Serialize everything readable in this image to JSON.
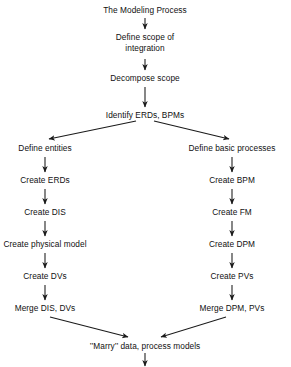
{
  "diagram": {
    "title": "The Modeling Process",
    "type": "flowchart",
    "orientation": "top-to-bottom",
    "colors": {
      "background": "#ffffff",
      "text": "#111111",
      "arrow": "#1a1a1a"
    },
    "nodes": [
      {
        "id": "title",
        "label": "The Modeling Process",
        "x": 145,
        "y": 5,
        "column": "center"
      },
      {
        "id": "scope",
        "label": "Define scope of\nintegration",
        "x": 145,
        "y": 32,
        "column": "center"
      },
      {
        "id": "decompose",
        "label": "Decompose scope",
        "x": 145,
        "y": 73,
        "column": "center"
      },
      {
        "id": "identify",
        "label": "Identify ERDs, BPMs",
        "x": 145,
        "y": 110,
        "column": "center"
      },
      {
        "id": "l1",
        "label": "Define entities",
        "x": 45,
        "y": 143,
        "column": "left"
      },
      {
        "id": "l2",
        "label": "Create ERDs",
        "x": 45,
        "y": 175,
        "column": "left"
      },
      {
        "id": "l3",
        "label": "Create DIS",
        "x": 45,
        "y": 207,
        "column": "left"
      },
      {
        "id": "l4",
        "label": "Create physical model",
        "x": 45,
        "y": 239,
        "column": "left"
      },
      {
        "id": "l5",
        "label": "Create DVs",
        "x": 45,
        "y": 271,
        "column": "left"
      },
      {
        "id": "l6",
        "label": "Merge DIS, DVs",
        "x": 45,
        "y": 303,
        "column": "left"
      },
      {
        "id": "r1",
        "label": "Define basic processes",
        "x": 232,
        "y": 143,
        "column": "right"
      },
      {
        "id": "r2",
        "label": "Create BPM",
        "x": 232,
        "y": 175,
        "column": "right"
      },
      {
        "id": "r3",
        "label": "Create FM",
        "x": 232,
        "y": 207,
        "column": "right"
      },
      {
        "id": "r4",
        "label": "Create DPM",
        "x": 232,
        "y": 239,
        "column": "right"
      },
      {
        "id": "r5",
        "label": "Create PVs",
        "x": 232,
        "y": 271,
        "column": "right"
      },
      {
        "id": "r6",
        "label": "Merge DPM, PVs",
        "x": 232,
        "y": 303,
        "column": "right"
      },
      {
        "id": "marry",
        "label": "’’Marry’’ data, process models",
        "x": 145,
        "y": 341,
        "column": "center"
      }
    ],
    "edges": [
      {
        "from": "title",
        "to": "scope",
        "kind": "vertical"
      },
      {
        "from": "scope",
        "to": "decompose",
        "kind": "vertical"
      },
      {
        "from": "decompose",
        "to": "identify",
        "kind": "vertical"
      },
      {
        "from": "identify",
        "to": "l1",
        "kind": "diagonal-left"
      },
      {
        "from": "identify",
        "to": "r1",
        "kind": "diagonal-right"
      },
      {
        "from": "l1",
        "to": "l2",
        "kind": "vertical"
      },
      {
        "from": "l2",
        "to": "l3",
        "kind": "vertical"
      },
      {
        "from": "l3",
        "to": "l4",
        "kind": "vertical"
      },
      {
        "from": "l4",
        "to": "l5",
        "kind": "vertical"
      },
      {
        "from": "l5",
        "to": "l6",
        "kind": "vertical"
      },
      {
        "from": "r1",
        "to": "r2",
        "kind": "vertical"
      },
      {
        "from": "r2",
        "to": "r3",
        "kind": "vertical"
      },
      {
        "from": "r3",
        "to": "r4",
        "kind": "vertical"
      },
      {
        "from": "r4",
        "to": "r5",
        "kind": "vertical"
      },
      {
        "from": "r5",
        "to": "r6",
        "kind": "vertical"
      },
      {
        "from": "l6",
        "to": "marry",
        "kind": "diagonal-right"
      },
      {
        "from": "r6",
        "to": "marry",
        "kind": "diagonal-left"
      },
      {
        "from": "marry",
        "to": "exit",
        "kind": "vertical"
      }
    ]
  }
}
